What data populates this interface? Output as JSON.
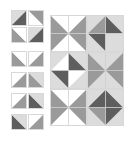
{
  "colors": {
    "white": "#ffffff",
    "light": "#dcdcdc",
    "mid": "#9a9a9a",
    "dark": "#5e5e5e",
    "grid": "#cfcfcf"
  },
  "small_tiles": [
    {
      "x": 11,
      "y": 10,
      "dir": "tr-bl",
      "a": "light",
      "b": "dark"
    },
    {
      "x": 28,
      "y": 10,
      "dir": "tl-br",
      "a": "white",
      "b": "mid"
    },
    {
      "x": 11,
      "y": 27,
      "dir": "tl-br",
      "a": "mid",
      "b": "white"
    },
    {
      "x": 28,
      "y": 27,
      "dir": "tr-bl",
      "a": "light",
      "b": "dark"
    },
    {
      "x": 11,
      "y": 51,
      "dir": "tl-br",
      "a": "mid",
      "b": "white"
    },
    {
      "x": 28,
      "y": 51,
      "dir": "tr-bl",
      "a": "white",
      "b": "mid"
    },
    {
      "x": 11,
      "y": 72,
      "dir": "tr-bl",
      "a": "white",
      "b": "mid"
    },
    {
      "x": 28,
      "y": 72,
      "dir": "tl-br",
      "a": "mid",
      "b": "light"
    },
    {
      "x": 11,
      "y": 93,
      "dir": "tr-bl",
      "a": "white",
      "b": "mid"
    },
    {
      "x": 28,
      "y": 93,
      "dir": "tl-br",
      "a": "dark",
      "b": "light"
    },
    {
      "x": 11,
      "y": 114,
      "dir": "tl-br",
      "a": "dark",
      "b": "light"
    },
    {
      "x": 28,
      "y": 114,
      "dir": "tr-bl",
      "a": "white",
      "b": "mid"
    }
  ],
  "big_tiles": [
    {
      "x": 50,
      "y": 15,
      "quads": [
        "mid",
        "mid",
        "white",
        "white"
      ],
      "style": "hourglass-h"
    },
    {
      "x": 87,
      "y": 15,
      "quads": [
        "mid",
        "dark",
        "dark",
        "light"
      ],
      "style": "diamond"
    },
    {
      "x": 50,
      "y": 52,
      "quads": [
        "white",
        "dark",
        "dark",
        "white"
      ],
      "style": "diamond-inner"
    },
    {
      "x": 87,
      "y": 52,
      "quads": [
        "mid",
        "mid",
        "mid",
        "mid"
      ],
      "style": "hourglass-v"
    },
    {
      "x": 50,
      "y": 89,
      "quads": [
        "mid",
        "mid",
        "white",
        "white"
      ],
      "style": "hourglass-h"
    },
    {
      "x": 87,
      "y": 89,
      "quads": [
        "dark",
        "dark",
        "mid",
        "dark"
      ],
      "style": "diamond"
    }
  ]
}
